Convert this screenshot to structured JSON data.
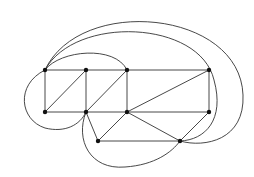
{
  "diagram": {
    "type": "graph",
    "nodes": [
      {
        "id": "A",
        "x": 45,
        "y": 70
      },
      {
        "id": "B",
        "x": 86,
        "y": 70
      },
      {
        "id": "C",
        "x": 127,
        "y": 70
      },
      {
        "id": "D",
        "x": 209,
        "y": 70
      },
      {
        "id": "E",
        "x": 45,
        "y": 112
      },
      {
        "id": "F",
        "x": 86,
        "y": 112
      },
      {
        "id": "G",
        "x": 127,
        "y": 112
      },
      {
        "id": "H",
        "x": 209,
        "y": 112
      },
      {
        "id": "I",
        "x": 98,
        "y": 141
      },
      {
        "id": "J",
        "x": 180,
        "y": 141
      }
    ],
    "straight_edges": [
      [
        "A",
        "B"
      ],
      [
        "B",
        "C"
      ],
      [
        "C",
        "D"
      ],
      [
        "E",
        "F"
      ],
      [
        "F",
        "G"
      ],
      [
        "G",
        "H"
      ],
      [
        "A",
        "E"
      ],
      [
        "B",
        "F"
      ],
      [
        "C",
        "G"
      ],
      [
        "D",
        "H"
      ],
      [
        "E",
        "B"
      ],
      [
        "F",
        "C"
      ],
      [
        "G",
        "D"
      ],
      [
        "F",
        "I"
      ],
      [
        "G",
        "I"
      ],
      [
        "G",
        "J"
      ],
      [
        "I",
        "J"
      ],
      [
        "H",
        "J"
      ]
    ],
    "curved_edges": [
      {
        "from": "A",
        "to": "C",
        "path": "M45,70 C60,50 115,45 127,70"
      },
      {
        "from": "A",
        "to": "J",
        "path": "M45,70 C75,15 200,20 214,80 C225,120 205,140 180,141"
      },
      {
        "from": "A",
        "to": "J",
        "path": "M45,70 C80,-5 240,10 243,95 C245,140 205,148 180,141"
      },
      {
        "from": "A",
        "to": "F",
        "path": "M45,70 C15,85 20,120 45,128 C65,133 80,125 86,112"
      },
      {
        "from": "F",
        "to": "J",
        "path": "M86,112 C75,140 90,170 125,167 C155,165 172,152 180,141"
      }
    ],
    "colors": {
      "edge": "#333333",
      "node": "#111111",
      "background": "#ffffff"
    }
  }
}
